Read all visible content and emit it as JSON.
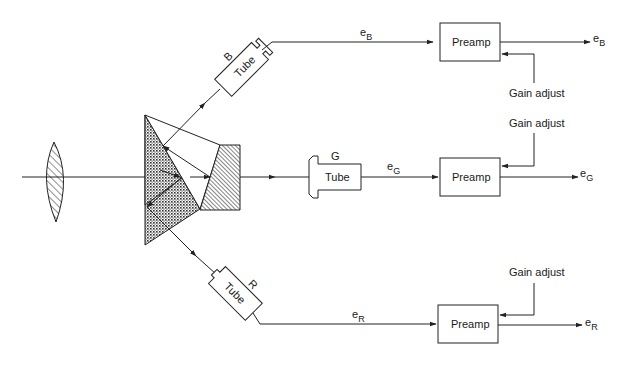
{
  "diagram": {
    "tubes": [
      {
        "id": "B",
        "label": "Tube",
        "channel": "B"
      },
      {
        "id": "G",
        "label": "Tube",
        "channel": "G"
      },
      {
        "id": "R",
        "label": "Tube",
        "channel": "R"
      }
    ],
    "signals": {
      "eB": {
        "base": "e",
        "sub": "B"
      },
      "eG": {
        "base": "e",
        "sub": "G"
      },
      "eR": {
        "base": "e",
        "sub": "R"
      }
    },
    "preamps": [
      {
        "label": "Preamp"
      },
      {
        "label": "Preamp"
      },
      {
        "label": "Preamp"
      }
    ],
    "gain_adjust": [
      "Gain adjust",
      "Gain adjust",
      "Gain adjust"
    ],
    "components": [
      "lens",
      "dichroic-prism",
      "trim-filter"
    ]
  }
}
